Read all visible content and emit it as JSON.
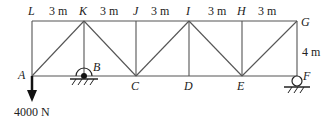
{
  "diagram": {
    "type": "truss",
    "nodes": {
      "L": {
        "label": "L"
      },
      "K": {
        "label": "K"
      },
      "J": {
        "label": "J"
      },
      "I": {
        "label": "I"
      },
      "H": {
        "label": "H"
      },
      "G": {
        "label": "G"
      },
      "A": {
        "label": "A"
      },
      "B": {
        "label": "B"
      },
      "C": {
        "label": "C"
      },
      "D": {
        "label": "D"
      },
      "E": {
        "label": "E"
      },
      "F": {
        "label": "F"
      }
    },
    "dimensions": {
      "panel1": "3 m",
      "panel2": "3 m",
      "panel3": "3 m",
      "panel4": "3 m",
      "panel5": "3 m",
      "height": "4 m"
    },
    "load": {
      "label": "4000 N",
      "at": "A",
      "direction": "down"
    },
    "supports": [
      {
        "node": "B",
        "type": "pin"
      },
      {
        "node": "F",
        "type": "roller"
      }
    ]
  }
}
